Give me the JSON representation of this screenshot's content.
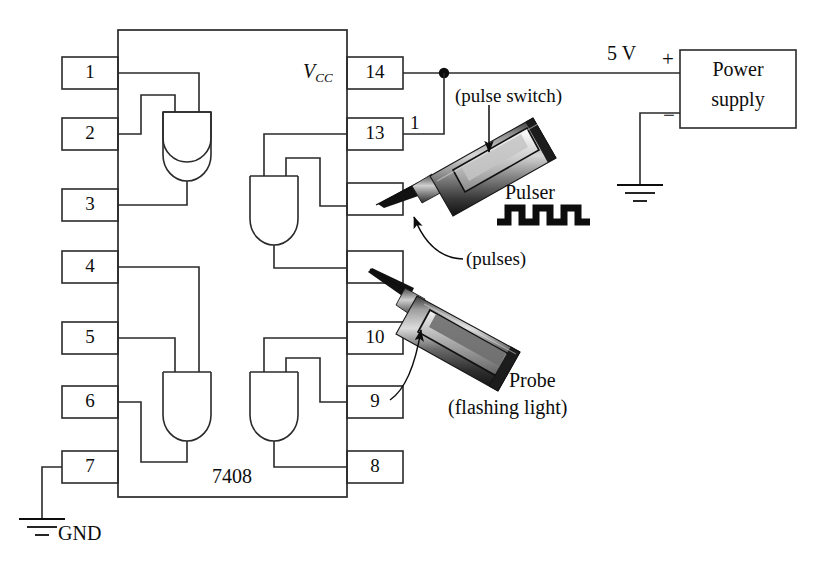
{
  "diagram": {
    "ic": {
      "part_number": "7408",
      "vcc_label": "V",
      "vcc_subscript": "CC",
      "pins_left": [
        "1",
        "2",
        "3",
        "4",
        "5",
        "6",
        "7"
      ],
      "pins_right": [
        "14",
        "13",
        "",
        "",
        "10",
        "9",
        "8"
      ],
      "gate_count": 4,
      "gate_type": "AND"
    },
    "power": {
      "voltage_label": "5 V",
      "plus_sign": "+",
      "minus_sign": "−",
      "supply_line1": "Power",
      "supply_line2": "supply"
    },
    "ground": {
      "gnd_label": "GND"
    },
    "annotations": {
      "pin13_wire_label": "1",
      "pulse_switch": "(pulse switch)",
      "pulser": "Pulser",
      "pulses": "(pulses)",
      "probe": "Probe",
      "probe_sub": "(flashing light)"
    },
    "colors": {
      "ink": "#0d0d0d",
      "line": "#2a2a2a",
      "probe_dark": "#111111",
      "probe_mid": "#6e6e6e",
      "probe_light": "#c8c8c8",
      "probe_body": "#9a9a9a",
      "background": "#ffffff"
    }
  }
}
